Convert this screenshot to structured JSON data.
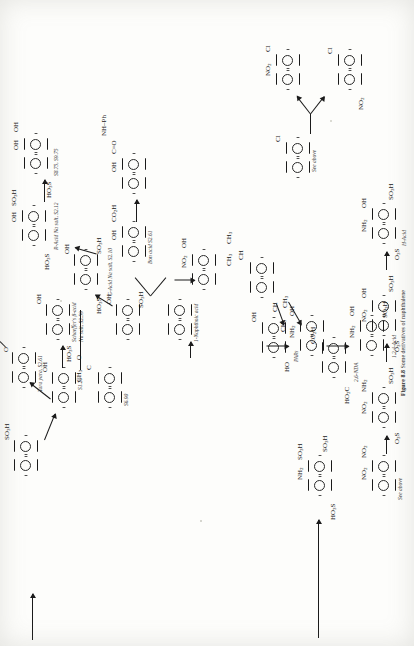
{
  "figure": {
    "number": "Figure 8.8",
    "caption": "Some derivatives of naphthalene",
    "page_type": "book-page-scan",
    "orientation": "rotated-90-ccw",
    "ink_color": "#1a1a1a",
    "paper_color": "#fdfdfb"
  },
  "structures": [
    {
      "id": "s01",
      "name": "naphthalene-2-sulfonic-acid",
      "substituents": [
        "SO<sub>3</sub>H"
      ],
      "note": ""
    },
    {
      "id": "s02",
      "name": "1-acetylnaphthalene",
      "substituents": [
        "CH<sub>3</sub>",
        "O"
      ],
      "note": "S6.90"
    },
    {
      "id": "s03",
      "name": "2-naphthol",
      "substituents": [
        "OH"
      ],
      "note": "S1.20"
    },
    {
      "id": "s04",
      "name": "nerolin-yara-yara",
      "substituents": [
        "Me",
        "O"
      ],
      "note": "Yara yara, S2.61"
    },
    {
      "id": "s05",
      "name": "schaeffers-beta-acid",
      "substituents": [
        "OH",
        "HO<sub>3</sub>S"
      ],
      "note": "Schaeffer's β-acid Na salt, S2.59"
    },
    {
      "id": "s06",
      "name": "1-naphthol-4-sulfonic-acid",
      "substituents": [
        "OH",
        "HO<sub>3</sub>S"
      ],
      "note": ""
    },
    {
      "id": "s07",
      "name": "g-acid-na-salt",
      "substituents": [
        "SO<sub>3</sub>H",
        "HO<sub>3</sub>S",
        "OH"
      ],
      "note": "G-Acid Na salt, S2.10"
    },
    {
      "id": "s08",
      "name": "r-acid-na-salt",
      "substituents": [
        "OH",
        "SO<sub>3</sub>H",
        "HO<sub>3</sub>S"
      ],
      "note": "R-Acid Na salt, S2.12"
    },
    {
      "id": "s09",
      "name": "dihydroxynaphthalene-sulfonic",
      "substituents": [
        "OH",
        "OH",
        "HO<sub>3</sub>S"
      ],
      "note": "S8.75, S9.75"
    },
    {
      "id": "s10",
      "name": "bon-acid",
      "substituents": [
        "OH",
        "CO<sub>2</sub>H"
      ],
      "note": "Bon acid S2.61"
    },
    {
      "id": "s11",
      "name": "naphthol-as-anilide",
      "substituents": [
        "OH",
        "C=O",
        "NH–Ph"
      ],
      "note": ""
    },
    {
      "id": "s12",
      "name": "1-naphthoic-acid",
      "substituents": [],
      "note": "1-Naphthoic acid"
    },
    {
      "id": "s13",
      "name": "1-nitroso-2-naphthol",
      "substituents": [
        "NO<sub>2</sub>",
        "OH"
      ],
      "note": ""
    },
    {
      "id": "s14",
      "name": "diisopropylnaphthalene",
      "substituents": [
        "CH<sub>3</sub>",
        "CH<sub>3</sub>",
        "CH",
        "CH<sub>3</sub>",
        "CH<sub>3</sub>",
        "CH"
      ],
      "note": ""
    },
    {
      "id": "s15",
      "name": "naphthalenediol-pars",
      "substituents": [
        "OH",
        "HO"
      ],
      "note": "PARs"
    },
    {
      "id": "s16",
      "name": "2,6-naphthalenedicarboxylic-acid",
      "substituents": [
        "CO<sub>2</sub>H",
        "HO<sub>2</sub>C"
      ],
      "note": "2,6-NDA"
    },
    {
      "id": "s17",
      "name": "1-amino-2-naphthol",
      "substituents": [
        "NH<sub>2</sub>",
        "OH"
      ],
      "note": ""
    },
    {
      "id": "s18",
      "name": "1-2-4-acid",
      "substituents": [
        "NH<sub>2</sub>",
        "OH",
        "SO<sub>3</sub>H"
      ],
      "note": "1,2,4-Acid"
    },
    {
      "id": "s19",
      "name": "1,8-dinitronaphthalene",
      "substituents": [
        "NO<sub>2</sub>",
        "NO<sub>2</sub>",
        "NO<sub>2</sub>",
        "NO<sub>2</sub>"
      ],
      "note": "See above"
    },
    {
      "id": "s20",
      "name": "nitro-amino-naphthalenedisulfonic",
      "substituents": [
        "NO<sub>2</sub>",
        "NH<sub>2</sub>",
        "SO<sub>3</sub>H",
        "O<sub>3</sub>S"
      ],
      "note": ""
    },
    {
      "id": "s21",
      "name": "nitro-hydroxy-naphthalenedisulfonic",
      "substituents": [
        "NO<sub>2</sub>",
        "OH",
        "SO<sub>3</sub>H",
        "O<sub>3</sub>S"
      ],
      "note": ""
    },
    {
      "id": "s22",
      "name": "h-acid",
      "substituents": [
        "NH<sub>2</sub>",
        "OH",
        "SO<sub>3</sub>H",
        "O<sub>3</sub>S"
      ],
      "note": "H-Acid"
    },
    {
      "id": "s23",
      "name": "amino-naphthalenetrisulfonic-acid",
      "substituents": [
        "NH<sub>2</sub>",
        "SO<sub>3</sub>H",
        "SO<sub>3</sub>H",
        "HO<sub>3</sub>S"
      ],
      "note": ""
    },
    {
      "id": "s24",
      "name": "1-chloronaphthalene",
      "substituents": [
        "Cl"
      ],
      "note": "See above"
    },
    {
      "id": "s25",
      "name": "chloro-nitronaphthalene-a",
      "substituents": [
        "NO<sub>2</sub>",
        "Cl"
      ],
      "note": ""
    },
    {
      "id": "s26",
      "name": "chloro-nitronaphthalene-b",
      "substituents": [
        "Cl",
        "NO<sub>2</sub>"
      ],
      "note": ""
    }
  ],
  "labels": {
    "schaeffer": "Schaeffer's β-acid",
    "schaeffer_salt": "Na salt, S2.59",
    "r_acid": "R-Acid Na salt, S2.12",
    "g_acid": "G-Acid Na salt, S2.10",
    "s8_s9": "S8.75, S9.75",
    "bon_acid": "Bon acid S2.61",
    "naphthoic": "1-Naphthoic acid",
    "yara": "Yara yara, S2.61",
    "s120": "S1.20",
    "s690": "S6.90",
    "pars": "PARs",
    "nda": "2,6-NDA",
    "acid124": "1,2,4-Acid",
    "hacid": "H-Acid",
    "see_above_1": "See above",
    "see_above_2": "See above"
  },
  "atoms": {
    "so3h": "SO",
    "so3h_sub": "3",
    "so3h_tail": "H",
    "ho3s": "HO",
    "ho3s_sub": "3",
    "ho3s_tail": "S",
    "oh": "OH",
    "ho": "HO",
    "nh2": "NH",
    "nh2_sub": "2",
    "no2": "NO",
    "no2_sub": "2",
    "co2h": "CO",
    "co2h_sub": "2",
    "co2h_tail": "H",
    "ho2c": "HO",
    "ho2c_sub": "2",
    "ho2c_tail": "C",
    "ch3": "CH",
    "ch3_sub": "3",
    "ch": "CH",
    "cl": "Cl",
    "me": "Me",
    "o": "O",
    "co": "C=O",
    "nhph": "NH–Ph",
    "o3s": "O",
    "o3s_sub": "3",
    "o3s_tail": "S"
  }
}
